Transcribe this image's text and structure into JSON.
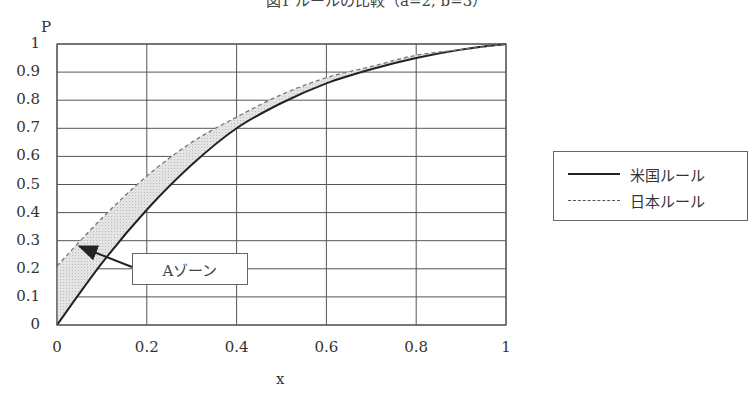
{
  "chart_data": {
    "type": "line",
    "title": "図1 ルールの比較（a=2, b=3）",
    "xlabel": "x",
    "ylabel": "P",
    "xlim": [
      0,
      1
    ],
    "ylim": [
      0,
      1
    ],
    "grid": true,
    "legend_position": "right",
    "x_ticks": [
      "0",
      "0.2",
      "0.4",
      "0.6",
      "0.8",
      "1"
    ],
    "y_ticks": [
      "0",
      "0.1",
      "0.2",
      "0.3",
      "0.4",
      "0.5",
      "0.6",
      "0.7",
      "0.8",
      "0.9",
      "1"
    ],
    "x": [
      0,
      0.1,
      0.2,
      0.3,
      0.4,
      0.5,
      0.6,
      0.7,
      0.8,
      0.9,
      1.0
    ],
    "series": [
      {
        "name": "米国ルール",
        "style": "solid",
        "color": "#222222",
        "values": [
          0.0,
          0.22,
          0.41,
          0.57,
          0.7,
          0.79,
          0.86,
          0.91,
          0.95,
          0.98,
          1.0
        ]
      },
      {
        "name": "日本ルール",
        "style": "dashed",
        "color": "#666666",
        "values": [
          0.21,
          0.38,
          0.53,
          0.65,
          0.74,
          0.82,
          0.88,
          0.92,
          0.96,
          0.98,
          1.0
        ]
      }
    ],
    "shaded_region": {
      "between": [
        "米国ルール",
        "日本ルール"
      ],
      "fill": "#d9d9d9"
    },
    "annotations": [
      {
        "text": "Aゾーン",
        "arrow_to": [
          0.05,
          0.28
        ]
      }
    ]
  },
  "labels": {
    "title": "図1 ルールの比較（a=2, b=3）",
    "y_axis": "P",
    "x_axis": "x",
    "annotation": "Aゾーン",
    "legend": [
      "米国ルール",
      "日本ルール"
    ]
  }
}
